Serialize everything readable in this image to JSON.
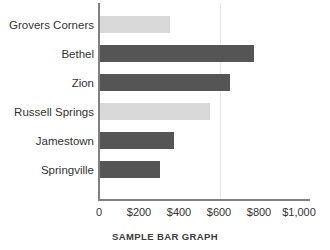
{
  "chart_data": {
    "type": "bar",
    "orientation": "horizontal",
    "title": "SAMPLE BAR GRAPH",
    "xlabel": "",
    "ylabel": "",
    "xlim": [
      0,
      1000
    ],
    "grid": true,
    "legend": "none",
    "categories": [
      "Grovers Corners",
      "Bethel",
      "Zion",
      "Russell Springs",
      "Jamestown",
      "Springville"
    ],
    "values": [
      350,
      770,
      650,
      550,
      370,
      300
    ],
    "bar_colors": [
      "#d9d9d9",
      "#555555",
      "#555555",
      "#d9d9d9",
      "#555555",
      "#555555"
    ],
    "tick_values": [
      0,
      200,
      400,
      600,
      800,
      1000
    ],
    "tick_labels": [
      "0",
      "$200",
      "$400",
      "$600",
      "$800",
      "$1,000"
    ],
    "gridline_values": [
      600
    ],
    "colors": {
      "bar_light": "#d9d9d9",
      "bar_dark": "#555555",
      "axis": "#808080",
      "grid": "#e6e6e6",
      "text": "#333333"
    }
  },
  "caption": "SAMPLE BAR GRAPH"
}
